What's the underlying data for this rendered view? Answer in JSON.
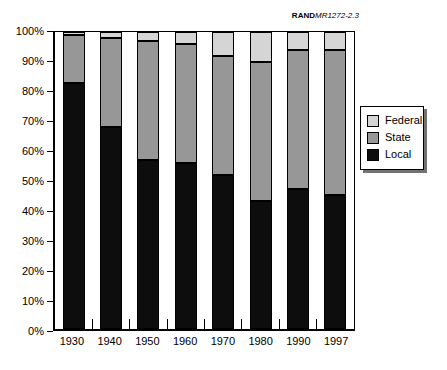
{
  "figure": {
    "label_brand": "RAND",
    "label_report": "MR1272-2.3"
  },
  "chart_data": {
    "type": "bar",
    "stacked": true,
    "unit": "percent",
    "title": "RANDMR1272-2.3",
    "xlabel": "",
    "ylabel": "",
    "ylim": [
      0,
      100
    ],
    "grid": false,
    "categories": [
      "1930",
      "1940",
      "1950",
      "1960",
      "1970",
      "1980",
      "1990",
      "1997"
    ],
    "series": [
      {
        "name": "Local",
        "color": "#0d0d0d",
        "values": [
          83,
          68,
          57,
          56,
          52,
          43,
          47,
          45
        ]
      },
      {
        "name": "State",
        "color": "#979797",
        "values": [
          16,
          30,
          40,
          40,
          40,
          47,
          47,
          49
        ]
      },
      {
        "name": "Federal",
        "color": "#d5d5d5",
        "values": [
          1,
          2,
          3,
          4,
          8,
          10,
          6,
          6
        ]
      }
    ],
    "y_ticks": [
      "0%",
      "10%",
      "20%",
      "30%",
      "40%",
      "50%",
      "60%",
      "70%",
      "80%",
      "90%",
      "100%"
    ],
    "legend": {
      "position": "right",
      "entries": [
        "Federal",
        "State",
        "Local"
      ]
    }
  }
}
